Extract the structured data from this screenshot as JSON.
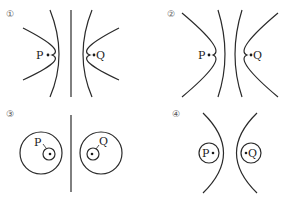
{
  "panels": [
    {
      "id": 1,
      "label": "①",
      "description": "Equipotential/field lines with a straight center line; P and Q on opposite sides",
      "points": {
        "P": "P",
        "Q": "Q"
      }
    },
    {
      "id": 2,
      "label": "②",
      "description": "Two curved inner lines bowing toward each other; P and Q on opposite sides",
      "points": {
        "P": "P",
        "Q": "Q"
      }
    },
    {
      "id": 3,
      "label": "③",
      "description": "Straight center line with two large circles, each containing a small offset circle around P and Q",
      "points": {
        "P": "P",
        "Q": "Q"
      }
    },
    {
      "id": 4,
      "label": "④",
      "description": "Two arcs bowing away from each other, small circles around P and Q",
      "points": {
        "P": "P",
        "Q": "Q"
      }
    }
  ],
  "colors": {
    "stroke": "#2a2a2a",
    "background": "#ffffff"
  }
}
